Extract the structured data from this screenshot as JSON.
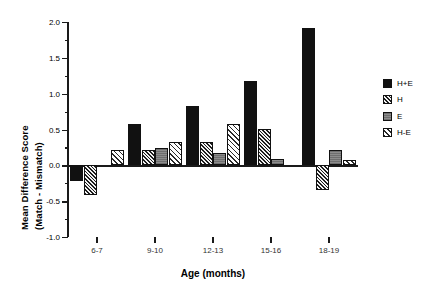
{
  "chart_data": {
    "type": "bar",
    "title": "",
    "xlabel": "Age (months)",
    "ylabel_line1": "Mean Difference Score",
    "ylabel_line2": "(Match - Mismatch)",
    "categories": [
      "6-7",
      "9-10",
      "12-13",
      "15-16",
      "18-19"
    ],
    "ylim": [
      -1.0,
      2.0
    ],
    "ytick_labels": [
      "2.0",
      "1.5",
      "1.0",
      "0.5",
      "0.0",
      "-0.5",
      "-1.0"
    ],
    "ytick_values": [
      2.0,
      1.5,
      1.0,
      0.5,
      0.0,
      -0.5,
      -1.0
    ],
    "yminor_values": [
      1.75,
      1.25,
      0.75,
      0.25,
      -0.25,
      -0.75
    ],
    "grid": false,
    "legend_position": "right",
    "series": [
      {
        "name": "H+E",
        "pattern": "solid-black",
        "values": [
          -0.22,
          0.58,
          0.83,
          1.17,
          1.92
        ]
      },
      {
        "name": "H",
        "pattern": "dense-diagonal",
        "values": [
          -0.42,
          0.22,
          0.32,
          0.51,
          -0.34
        ]
      },
      {
        "name": "E",
        "pattern": "solid-gray",
        "values": [
          0.0,
          0.24,
          0.17,
          0.09,
          0.22
        ]
      },
      {
        "name": "H-E",
        "pattern": "light-diagonal",
        "values": [
          0.22,
          0.32,
          0.58,
          0.0,
          0.07
        ]
      }
    ]
  },
  "legend": {
    "items": [
      {
        "label": "H+E",
        "pattern": "solid-black"
      },
      {
        "label": "H",
        "pattern": "dense-diagonal"
      },
      {
        "label": "E",
        "pattern": "solid-gray"
      },
      {
        "label": "H-E",
        "pattern": "light-diagonal"
      }
    ]
  },
  "colors": {
    "axis": "#1a1a1a",
    "bar_dark": "#111111",
    "bar_gray": "#7f7f7f",
    "background": "#ffffff"
  }
}
